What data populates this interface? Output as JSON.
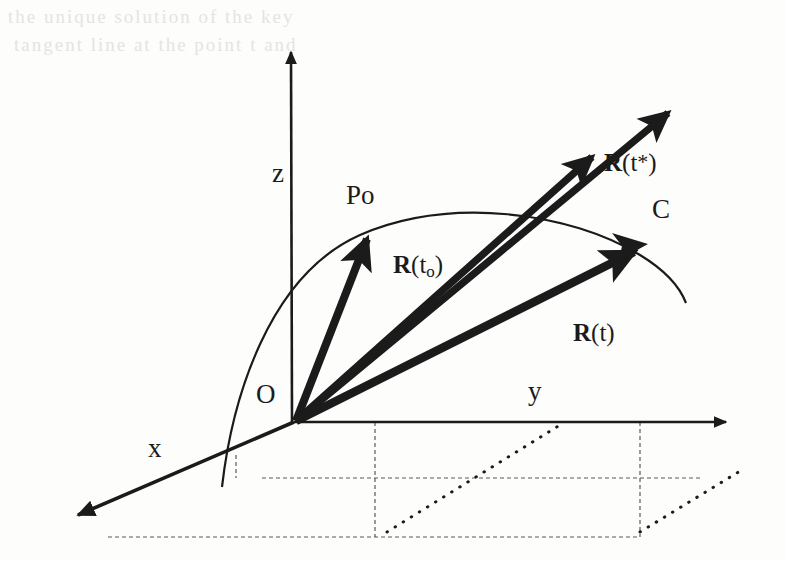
{
  "figure": {
    "type": "vector-diagram",
    "background_color": "#fdfdfc",
    "ink_color": "#1b1b1b"
  },
  "axes": [
    {
      "name": "x",
      "label": "x",
      "label_x": 148,
      "label_y": 435,
      "direction": "down-left"
    },
    {
      "name": "y",
      "label": "y",
      "label_x": 528,
      "label_y": 378,
      "direction": "right"
    },
    {
      "name": "z",
      "label": "z",
      "label_x": 272,
      "label_y": 160,
      "direction": "up"
    }
  ],
  "points": [
    {
      "name": "origin",
      "label": "O",
      "label_x": 256,
      "label_y": 381,
      "x": 294,
      "y": 422
    },
    {
      "name": "initial-point",
      "label": "Po",
      "label_x": 346,
      "label_y": 182,
      "x": 370,
      "y": 228
    },
    {
      "name": "curve-label",
      "label": "C",
      "label_x": 652,
      "label_y": 196,
      "x": 685,
      "y": 300
    }
  ],
  "vectors": [
    {
      "name": "vector-to-Po",
      "label": "",
      "from": [
        294,
        422
      ],
      "to": [
        370,
        228
      ],
      "label_x": null,
      "label_y": null
    },
    {
      "name": "vector-R-t0",
      "label_prefix": "R",
      "label_open": "(t",
      "label_sub": "o",
      "label_close": ")",
      "label_text": "R(to)",
      "from": [
        294,
        422
      ],
      "to": [
        678,
        105
      ],
      "label_x": 393,
      "label_y": 252
    },
    {
      "name": "vector-R-tstar",
      "label_prefix": "R",
      "label_open": "(t",
      "label_sup": "*",
      "label_close": ")",
      "label_text": "R(t*)",
      "from": [
        294,
        422
      ],
      "to": [
        600,
        147
      ],
      "label_x": 604,
      "label_y": 150
    },
    {
      "name": "vector-R-t",
      "label_prefix": "R",
      "label_open": "(t",
      "label_close": ")",
      "label_text": "R(t)",
      "from": [
        294,
        422
      ],
      "to": [
        645,
        245
      ],
      "label_x": 573,
      "label_y": 320
    }
  ],
  "curve": {
    "name": "space-curve-C",
    "label": "C",
    "style": "solid thin arc"
  },
  "guides": {
    "ground_plane_style": "dashed",
    "projection_style": "dotted"
  },
  "ghost_text": {
    "line1": "the   unique   solution   of   the   key",
    "line2": "tangent line   at   the   point   t   and"
  }
}
